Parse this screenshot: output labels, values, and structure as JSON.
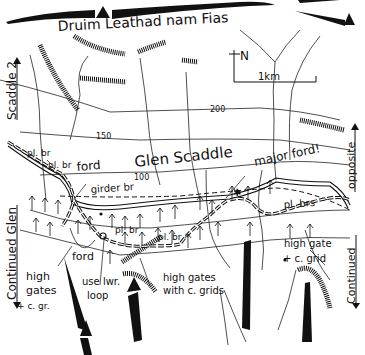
{
  "map": {
    "title": "Druim Leathad nam Fias",
    "north_label": "N",
    "scale_label": "1km",
    "valley_label": "Glen Scaddle",
    "left_edge_top": "Scaddle 2",
    "left_edge_bottom": "Continued Glen",
    "right_edge_top": "opposite",
    "right_edge_bottom": "Continued",
    "contours": [
      {
        "value": "200",
        "unit": "m"
      },
      {
        "value": "150",
        "unit": "m"
      },
      {
        "value": "100",
        "unit": "m"
      }
    ],
    "annotations": {
      "pl_br_1": "pl. br",
      "pl_br_2": "pl. br",
      "ford_1": "ford",
      "girder_br": "girder br",
      "major_ford": "major ford!",
      "pl_brs": "pl. brs",
      "pl_br_3": "pl. br",
      "pl_br_4": "pl. br",
      "ford_2": "ford",
      "high_gates_1a": "high",
      "high_gates_1b": "gates",
      "high_gates_1c": "+ c. gr.",
      "use_lwr_a": "use lwr.",
      "use_lwr_b": "loop",
      "high_gates_2a": "high gates",
      "high_gates_2b": "with c. grids",
      "high_gate_3a": "high gate",
      "high_gate_3b": "+ c. grid"
    },
    "colors": {
      "ink": "#111111",
      "paper": "#ffffff"
    }
  }
}
